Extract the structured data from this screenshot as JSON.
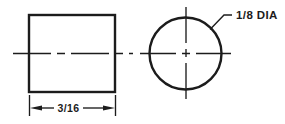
{
  "diagram": {
    "kind": "technical-drawing",
    "colors": {
      "line": "#1c1c1c",
      "background": "#ffffff"
    },
    "side_view": {
      "shape": "rectangle",
      "width_dimension_label": "3/16"
    },
    "end_view": {
      "shape": "circle",
      "diameter_callout_label": "1/8 DIA"
    }
  }
}
